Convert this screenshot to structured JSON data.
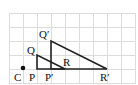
{
  "diagram": {
    "type": "dilation-on-grid",
    "grid": {
      "x0": 9,
      "y0": 13,
      "cell": 14,
      "cols": 9,
      "rows": 5,
      "color": "#d9d9d9"
    },
    "center": {
      "label": "C",
      "x": 23,
      "y": 69
    },
    "original_triangle": {
      "vertices": [
        {
          "label": "P",
          "x": 37,
          "y": 69
        },
        {
          "label": "Q",
          "x": 37,
          "y": 55
        },
        {
          "label": "R",
          "x": 65,
          "y": 69
        }
      ]
    },
    "image_triangle": {
      "vertices": [
        {
          "label": "P′",
          "x": 51,
          "y": 69
        },
        {
          "label": "Q′",
          "x": 51,
          "y": 41
        },
        {
          "label": "R′",
          "x": 107,
          "y": 69
        }
      ]
    },
    "labels": {
      "C": "C",
      "P": "P",
      "Q": "Q",
      "R": "R",
      "P_prime": "P′",
      "Q_prime": "Q′",
      "R_prime": "R′"
    },
    "line_color": "#222222"
  }
}
